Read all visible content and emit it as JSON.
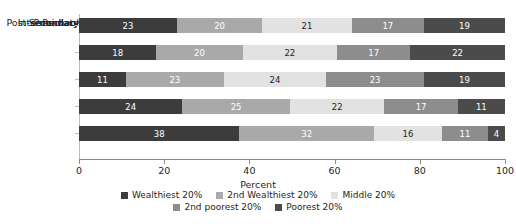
{
  "chart_data": {
    "type": "bar",
    "orientation": "horizontal",
    "stacked": true,
    "stack_mode": "percent",
    "title": "",
    "xlabel": "Percent",
    "ylabel": "",
    "xlim": [
      0,
      100
    ],
    "xticks": [
      0,
      20,
      40,
      60,
      80,
      100
    ],
    "xticklabels": [
      "0",
      "20",
      "40",
      "60",
      "80",
      "100"
    ],
    "grid": false,
    "legend_position": "bottom",
    "categories": [
      "Preschool",
      "Primary",
      "Intermediate",
      "Secondary",
      "Post-secondary"
    ],
    "series": [
      {
        "name": "Wealthiest 20%",
        "color": "#3c3c3c",
        "label_color": "#ffffff",
        "values": [
          23,
          18,
          11,
          24,
          38
        ]
      },
      {
        "name": "2nd Wealthiest 20%",
        "color": "#a9a9a9",
        "label_color": "#ffffff",
        "values": [
          20,
          20,
          23,
          25,
          32
        ]
      },
      {
        "name": "Middle 20%",
        "color": "#e2e2e2",
        "label_color": "#231f20",
        "values": [
          21,
          22,
          24,
          22,
          16
        ]
      },
      {
        "name": "2nd poorest 20%",
        "color": "#8d8d8d",
        "label_color": "#ffffff",
        "values": [
          17,
          17,
          23,
          17,
          11
        ]
      },
      {
        "name": "Poorest 20%",
        "color": "#4b4b4b",
        "label_color": "#ffffff",
        "values": [
          19,
          22,
          19,
          11,
          4
        ]
      }
    ]
  },
  "legend": {
    "row1": [
      "Wealthiest 20%",
      "2nd Wealthiest 20%",
      "Middle 20%"
    ],
    "row2": [
      "2nd poorest 20%",
      "Poorest 20%"
    ]
  },
  "colors": {
    "wealthiest": "#3c3c3c",
    "second_wealthiest": "#a9a9a9",
    "middle": "#e2e2e2",
    "second_poorest": "#8d8d8d",
    "poorest": "#4b4b4b",
    "axis": "#8c8c8c",
    "text": "#231f20"
  }
}
